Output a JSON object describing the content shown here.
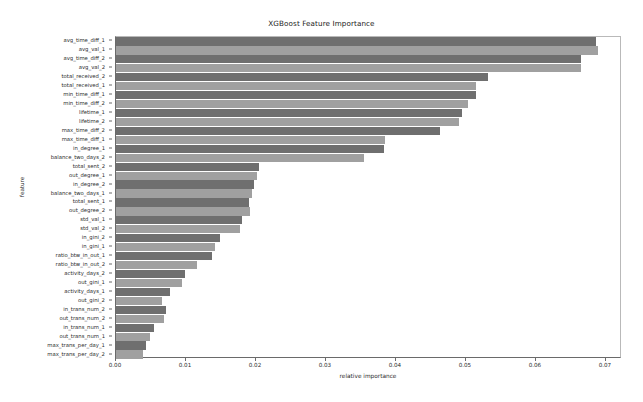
{
  "chart_data": {
    "type": "bar",
    "orientation": "horizontal",
    "title": "XGBoost Feature Importance",
    "xlabel": "relative importance",
    "ylabel": "feature",
    "xlim": [
      0.0,
      0.0723
    ],
    "grid": false,
    "legend": null,
    "xticks": [
      "0.00",
      "0.01",
      "0.02",
      "0.03",
      "0.04",
      "0.05",
      "0.06",
      "0.07"
    ],
    "xtick_values": [
      0.0,
      0.01,
      0.02,
      0.03,
      0.04,
      0.05,
      0.06,
      0.07
    ],
    "bar_color": "#8a8a8a",
    "categories": [
      "avg_time_diff_1",
      "avg_val_1",
      "avg_time_diff_2",
      "avg_val_2",
      "total_received_2",
      "total_received_1",
      "min_time_diff_1",
      "min_time_diff_2",
      "lifetime_1",
      "lifetime_2",
      "max_time_diff_2",
      "max_time_diff_1",
      "in_degree_1",
      "balance_two_days_2",
      "total_sent_2",
      "out_degree_1",
      "in_degree_2",
      "balance_two_days_1",
      "total_sent_1",
      "out_degree_2",
      "std_val_1",
      "std_val_2",
      "in_gini_2",
      "in_gini_1",
      "ratio_btw_in_out_1",
      "ratio_btw_in_out_2",
      "activity_days_2",
      "out_gini_1",
      "activity_days_1",
      "out_gini_2",
      "in_trans_num_2",
      "out_trans_num_2",
      "in_trans_num_1",
      "out_trans_num_1",
      "max_trans_per_day_1",
      "max_trans_per_day_2"
    ],
    "values": [
      0.0686,
      0.0689,
      0.0665,
      0.0665,
      0.0531,
      0.0515,
      0.0514,
      0.0503,
      0.0494,
      0.049,
      0.0463,
      0.0384,
      0.0383,
      0.0355,
      0.0205,
      0.0202,
      0.0197,
      0.0194,
      0.019,
      0.0191,
      0.018,
      0.0177,
      0.0148,
      0.0142,
      0.0137,
      0.0116,
      0.0098,
      0.0094,
      0.0077,
      0.0066,
      0.0072,
      0.0068,
      0.0054,
      0.0048,
      0.0043,
      0.0038
    ]
  }
}
